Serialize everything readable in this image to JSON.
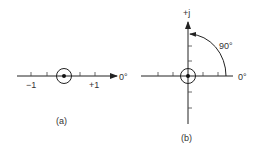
{
  "diagram_a": {
    "caption": "(a)",
    "axis_label_right": "0°",
    "tick_label_minus": "−1",
    "tick_label_plus": "+1"
  },
  "diagram_b": {
    "caption": "(b)",
    "axis_label_top": "+j",
    "axis_label_right": "0°",
    "angle_label": "90°"
  },
  "colors": {
    "line": "#222222",
    "text": "#333333",
    "background": "#ffffff"
  }
}
